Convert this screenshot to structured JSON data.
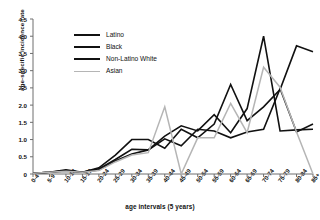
{
  "chart_data": {
    "type": "line",
    "title": "",
    "xlabel": "age intervals (5 years)",
    "ylabel": "age-specific incidence rate",
    "categories": [
      "0-4",
      "5-9",
      "10-14",
      "15-19",
      "20-24",
      "25-29",
      "30-34",
      "35-39",
      "40-44",
      "45-49",
      "50-54",
      "55-59",
      "60-64",
      "65-69",
      "70-74",
      "75-79",
      "80-84",
      "85+"
    ],
    "ylim": [
      0,
      4.5
    ],
    "yticks": [
      "0",
      "0.5",
      "1.0",
      "1.5",
      "2.0",
      "2.5",
      "3.0",
      "3.5",
      "4.0",
      "4.5"
    ],
    "ytick_values": [
      0,
      0.5,
      1.0,
      1.5,
      2.0,
      2.5,
      3.0,
      3.5,
      4.0,
      4.5
    ],
    "grid": false,
    "legend_position": "upper-left-inside",
    "series": [
      {
        "name": "Latino",
        "color": "#111111",
        "values": [
          0.02,
          0.05,
          0.12,
          0.05,
          0.18,
          0.55,
          1.0,
          1.0,
          0.75,
          1.3,
          1.05,
          1.45,
          2.6,
          1.55,
          1.95,
          2.45,
          3.72,
          3.55
        ]
      },
      {
        "name": "Black",
        "color": "#111111",
        "values": [
          0.02,
          0.05,
          0.1,
          0.05,
          0.15,
          0.42,
          0.72,
          0.7,
          1.1,
          1.4,
          1.25,
          1.72,
          1.2,
          1.9,
          4.0,
          1.25,
          1.28,
          1.3
        ]
      },
      {
        "name": "Non-Latino White",
        "color": "#111111",
        "values": [
          0.02,
          0.05,
          0.08,
          0.05,
          0.12,
          0.38,
          0.58,
          0.7,
          1.02,
          0.82,
          1.3,
          1.25,
          1.05,
          1.22,
          1.3,
          2.48,
          1.22,
          1.45
        ]
      },
      {
        "name": "Asian",
        "color": "#b5b5b5",
        "values": [
          0.02,
          0.05,
          0.08,
          0.05,
          0.1,
          0.35,
          0.55,
          0.62,
          1.95,
          0.0,
          1.05,
          1.05,
          2.05,
          1.2,
          3.1,
          2.52,
          1.22,
          0.0
        ]
      }
    ]
  },
  "axis": {
    "y_title": "age-specific incidence rate",
    "x_title": "age intervals (5 years)"
  },
  "legend": {
    "items": [
      {
        "label": "Latino",
        "color": "#111111",
        "width": "2.2px"
      },
      {
        "label": "Black",
        "color": "#111111",
        "width": "2.2px"
      },
      {
        "label": "Non-Latino White",
        "color": "#111111",
        "width": "2.2px"
      },
      {
        "label": "Asian",
        "color": "#b5b5b5",
        "width": "1.6px"
      }
    ]
  }
}
